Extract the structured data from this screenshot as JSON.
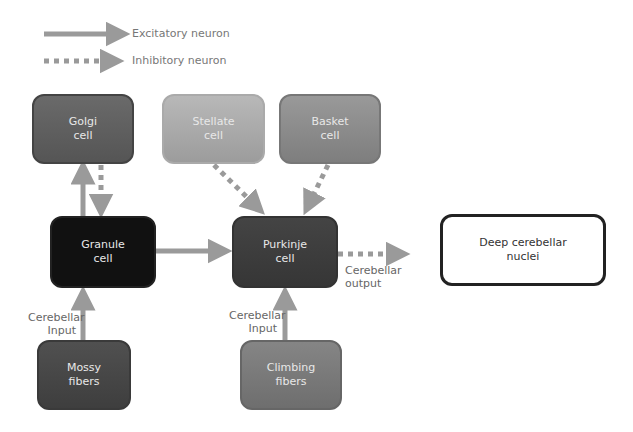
{
  "legend": {
    "excitatory": "Excitatory neuron",
    "inhibitory": "Inhibitory neuron"
  },
  "nodes": {
    "golgi": {
      "line1": "Golgi",
      "line2": "cell"
    },
    "stellate": {
      "line1": "Stellate",
      "line2": "cell"
    },
    "basket": {
      "line1": "Basket",
      "line2": "cell"
    },
    "granule": {
      "line1": "Granule",
      "line2": "cell"
    },
    "purkinje": {
      "line1": "Purkinje",
      "line2": "cell"
    },
    "deep": {
      "line1": "Deep cerebellar",
      "line2": "nuclei"
    },
    "mossy": {
      "line1": "Mossy",
      "line2": "fibers"
    },
    "climbing": {
      "line1": "Climbing",
      "line2": "fibers"
    }
  },
  "labels": {
    "input_left": {
      "line1": "Cerebellar",
      "line2": "Input"
    },
    "input_right": {
      "line1": "Cerebellar",
      "line2": "Input"
    },
    "output": {
      "line1": "Cerebellar",
      "line2": "output"
    }
  },
  "colors": {
    "arrow": "#9a9a9a",
    "golgi": "#5f5f5f",
    "stellate": "#a8a8a8",
    "basket": "#8a8a8a",
    "granule": "#111111",
    "purkinje": "#3c3c3c",
    "mossy": "#4a4a4a",
    "climbing": "#7a7a7a"
  }
}
